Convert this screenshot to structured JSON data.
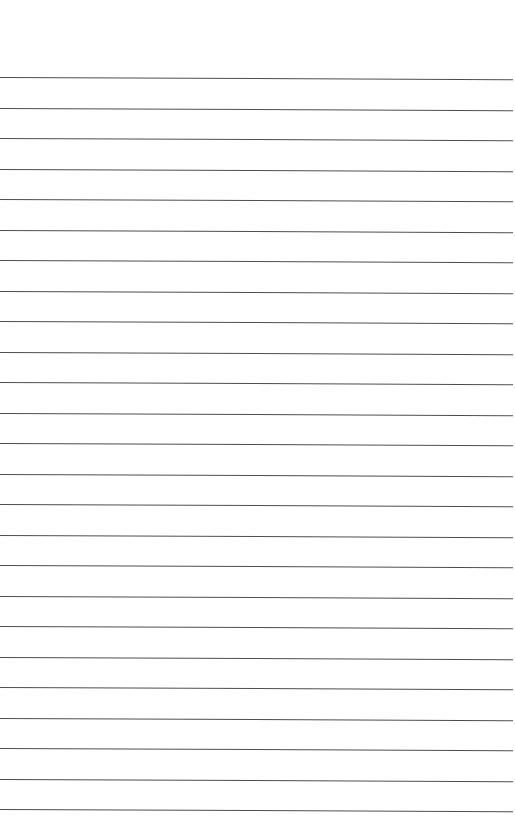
{
  "page": {
    "type": "ruled-sheet",
    "background": "#ffffff",
    "line_color": "#3a3a3a",
    "line_count": 25,
    "first_line_y": 77,
    "line_spacing": 30.5,
    "text_content": []
  }
}
